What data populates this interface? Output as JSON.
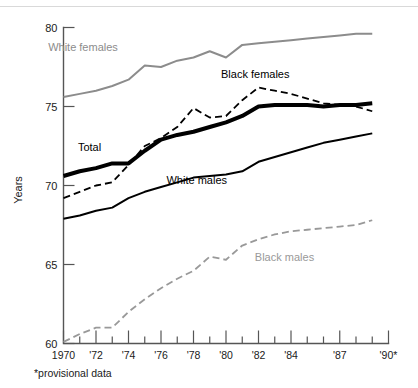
{
  "figure": {
    "footnote": "*provisional data",
    "y_axis_title": "Years"
  },
  "chart_data": {
    "type": "line",
    "title": "",
    "xlabel": "",
    "ylabel": "Years",
    "ylim": [
      60,
      80
    ],
    "xlim": [
      1970,
      1990
    ],
    "grid": false,
    "legend": "inline-annotations",
    "y_ticks": [
      60,
      65,
      70,
      75,
      80
    ],
    "y_tick_labels": [
      "60",
      "65",
      "70",
      "75",
      "80"
    ],
    "x_ticks": [
      1970,
      1971,
      1972,
      1973,
      1974,
      1975,
      1976,
      1977,
      1978,
      1979,
      1980,
      1981,
      1982,
      1983,
      1984,
      1985,
      1986,
      1987,
      1988,
      1989,
      1990
    ],
    "x_tick_labels": [
      "1970",
      "",
      "'72",
      "",
      "'74",
      "",
      "'76",
      "",
      "'78",
      "",
      "'80",
      "",
      "'82",
      "",
      "'84",
      "",
      "",
      "'87",
      "",
      "",
      "'90*"
    ],
    "x": [
      1970,
      1971,
      1972,
      1973,
      1974,
      1975,
      1976,
      1977,
      1978,
      1979,
      1980,
      1981,
      1982,
      1983,
      1984,
      1985,
      1986,
      1987,
      1988,
      1989
    ],
    "series": [
      {
        "name": "White females",
        "label": "White females",
        "color": "#8c8c8c",
        "style": "solid",
        "width": 2.0,
        "values": [
          75.6,
          75.8,
          76.0,
          76.3,
          76.7,
          77.6,
          77.5,
          77.9,
          78.1,
          78.5,
          78.1,
          78.9,
          79.0,
          79.1,
          79.2,
          79.3,
          79.4,
          79.5,
          79.6,
          79.6
        ]
      },
      {
        "name": "Total",
        "label": "Total",
        "color": "#000000",
        "style": "solid",
        "width": 4.0,
        "values": [
          70.6,
          70.9,
          71.1,
          71.4,
          71.4,
          72.2,
          72.9,
          73.2,
          73.4,
          73.7,
          74.0,
          74.4,
          75.0,
          75.1,
          75.1,
          75.1,
          75.0,
          75.1,
          75.1,
          75.2
        ]
      },
      {
        "name": "Black females",
        "label": "Black females",
        "color": "#000000",
        "style": "dashed",
        "width": 1.8,
        "values": [
          69.2,
          69.6,
          70.0,
          70.2,
          71.3,
          72.5,
          73.0,
          73.7,
          74.9,
          74.3,
          74.4,
          75.4,
          76.2,
          76.0,
          75.8,
          75.5,
          75.2,
          75.1,
          75.0,
          74.7
        ]
      },
      {
        "name": "White males",
        "label": "White males",
        "color": "#000000",
        "style": "solid",
        "width": 2.0,
        "values": [
          67.9,
          68.1,
          68.4,
          68.6,
          69.2,
          69.6,
          69.9,
          70.2,
          70.5,
          70.6,
          70.7,
          70.9,
          71.5,
          71.8,
          72.1,
          72.4,
          72.7,
          72.9,
          73.1,
          73.3
        ]
      },
      {
        "name": "Black males",
        "label": "Black males",
        "color": "#999999",
        "style": "dashed",
        "width": 1.8,
        "values": [
          60.1,
          60.6,
          61.0,
          61.0,
          62.0,
          62.8,
          63.5,
          64.1,
          64.6,
          65.5,
          65.3,
          66.2,
          66.6,
          66.9,
          67.1,
          67.2,
          67.3,
          67.4,
          67.5,
          67.8
        ]
      }
    ],
    "annotations": [
      {
        "text": "White females",
        "x": 1971.2,
        "y": 78.5,
        "color": "#8c8c8c"
      },
      {
        "text": "Black females",
        "x": 1981.8,
        "y": 76.8,
        "color": "#000000"
      },
      {
        "text": "Total",
        "x": 1971.6,
        "y": 72.2,
        "color": "#000000"
      },
      {
        "text": "White males",
        "x": 1978.2,
        "y": 70.1,
        "color": "#000000"
      },
      {
        "text": "Black males",
        "x": 1983.6,
        "y": 65.2,
        "color": "#999999"
      }
    ]
  }
}
